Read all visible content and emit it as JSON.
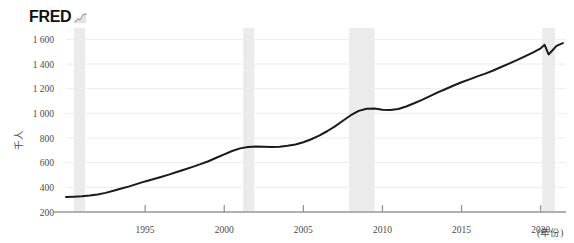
{
  "branding": {
    "wordmark": "FRED",
    "mark_icon": "fred-graph-icon"
  },
  "chart_data": {
    "type": "line",
    "title": "",
    "subtitle": "",
    "xlabel": "(年份)",
    "ylabel": "千人",
    "xlim": [
      1990.0,
      2021.6
    ],
    "ylim": [
      200,
      1660
    ],
    "grid": true,
    "legend": null,
    "legend_position": "none",
    "line_color": "#1a1a1a",
    "recession_band_color": "#ebebeb",
    "axis_color": "#9a9a9a",
    "grid_color": "#ececec",
    "y_ticks": [
      200,
      400,
      600,
      800,
      1000,
      1200,
      1400,
      1600
    ],
    "y_tick_labels": [
      "200",
      "400",
      "600",
      "800",
      "1 000",
      "1 200",
      "1 400",
      "1 600"
    ],
    "x_ticks": [
      1995,
      2000,
      2005,
      2010,
      2015,
      2020
    ],
    "x_tick_labels": [
      "1995",
      "2000",
      "2005",
      "2010",
      "2015",
      "2020"
    ],
    "recession_bands": [
      {
        "start": 1990.5,
        "end": 1991.2
      },
      {
        "start": 2001.2,
        "end": 2001.9
      },
      {
        "start": 2007.9,
        "end": 2009.5
      },
      {
        "start": 2020.1,
        "end": 2020.9
      }
    ],
    "series": [
      {
        "name": "千人",
        "x": [
          1990.0,
          1990.5,
          1991.0,
          1991.5,
          1992.0,
          1992.5,
          1993.0,
          1993.5,
          1994.0,
          1994.5,
          1995.0,
          1995.5,
          1996.0,
          1996.5,
          1997.0,
          1997.5,
          1998.0,
          1998.5,
          1999.0,
          1999.5,
          2000.0,
          2000.5,
          2001.0,
          2001.5,
          2002.0,
          2002.5,
          2003.0,
          2003.5,
          2004.0,
          2004.5,
          2005.0,
          2005.5,
          2006.0,
          2006.5,
          2007.0,
          2007.5,
          2008.0,
          2008.5,
          2009.0,
          2009.5,
          2010.0,
          2010.5,
          2011.0,
          2011.5,
          2012.0,
          2012.5,
          2013.0,
          2013.5,
          2014.0,
          2014.5,
          2015.0,
          2015.5,
          2016.0,
          2016.5,
          2017.0,
          2017.5,
          2018.0,
          2018.5,
          2019.0,
          2019.5,
          2020.0,
          2020.25,
          2020.5,
          2020.75,
          2021.0,
          2021.4
        ],
        "y": [
          322,
          324,
          327,
          333,
          342,
          355,
          372,
          390,
          408,
          428,
          448,
          466,
          484,
          503,
          524,
          545,
          566,
          588,
          612,
          640,
          668,
          695,
          716,
          728,
          732,
          730,
          728,
          730,
          737,
          748,
          766,
          790,
          820,
          855,
          895,
          940,
          985,
          1020,
          1038,
          1040,
          1030,
          1028,
          1036,
          1056,
          1082,
          1110,
          1140,
          1170,
          1198,
          1226,
          1252,
          1276,
          1300,
          1322,
          1348,
          1376,
          1404,
          1432,
          1462,
          1492,
          1528,
          1556,
          1478,
          1512,
          1548,
          1570
        ]
      }
    ]
  }
}
